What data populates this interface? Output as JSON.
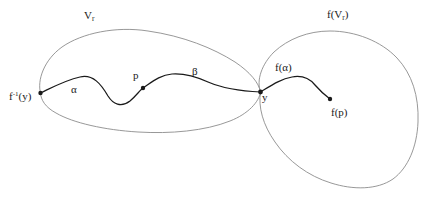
{
  "figure": {
    "width": 427,
    "height": 202,
    "background_color": "#ffffff",
    "outline_color": "#8c8c8c",
    "path_color": "#1a1a1a",
    "text_color": "#1a1a1a"
  },
  "labels": {
    "domain_region": {
      "base": "V",
      "sub": "r"
    },
    "image_region": {
      "prefix": "f(V",
      "sub": "r",
      "suffix": ")"
    },
    "preimage_point": {
      "base": "f",
      "sup": "-1",
      "suffix": "(y)"
    },
    "alpha": "α",
    "beta": "β",
    "point_p": "p",
    "point_y": "y",
    "f_alpha": "f(α)",
    "f_p": "f(p)"
  },
  "points": [
    {
      "name": "f-inverse-of-y",
      "x": 40,
      "y": 93
    },
    {
      "name": "p",
      "x": 143,
      "y": 88
    },
    {
      "name": "y",
      "x": 260,
      "y": 92
    },
    {
      "name": "f-of-p",
      "x": 330,
      "y": 99
    }
  ],
  "shapes": {
    "left_blob_path": "M 40.5,93 C 37,80 44,60 62,47 C 82,33 116,26 148,31 C 183,36 213,48 235,62 C 250,72 259,83 260.5,92 C 259,102 248,114 230,121 C 205,131 170,134 138,132 C 105,130 73,123 56,113 C 45,107 41,100 40.5,93 Z",
    "right_blob_path": "M 260.5,92 C 256,80 262,64 274,52 C 288,39 308,31 330,31 C 355,31 381,41 397,58 C 412,74 419,96 418,122 C 417,147 408,168 393,179 C 377,190 353,190 331,183 C 308,176 288,161 275,142 C 263,125 258,107 260.5,92 Z",
    "alpha_beta_curve": "M 40.5,93 C 55,86 66,80 80,77 C 93,74 101,84 108,96 C 113,104 121,108 130,101 C 136,96 140,90 143,88 C 152,82 160,75 172,74 C 186,73 197,77 208,82 C 222,88 238,91 260.5,92",
    "f_alpha_curve": "M 260.5,92 C 272,85 281,79 292,77 C 303,75 310,79 315,85 C 321,92 326,96 330,99"
  },
  "annotation_notes": {
    "regions_touch_at": "y",
    "left_region_contains": [
      "f-inverse-of-y",
      "p",
      "alpha",
      "beta"
    ],
    "right_region_contains": [
      "y",
      "f(alpha)",
      "f(p)"
    ]
  }
}
